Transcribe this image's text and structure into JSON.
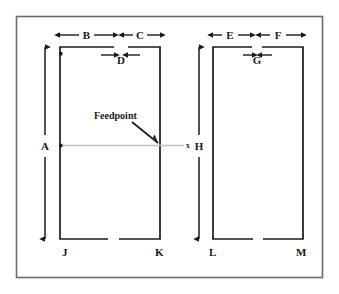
{
  "figure": {
    "background_color": "#ffffff",
    "frame_color": "#555555",
    "line_color": "#1a1a1a",
    "feedline_color": "#b8b8b8"
  },
  "callout": {
    "label": "Feedpoint"
  },
  "dimensions": {
    "vertical": [
      {
        "id": "A",
        "label": "A",
        "element": "left"
      },
      {
        "id": "H",
        "label": "H",
        "element": "right"
      }
    ],
    "horizontal_outer": [
      {
        "id": "B",
        "label": "B",
        "element": "left",
        "side": "left"
      },
      {
        "id": "C",
        "label": "C",
        "element": "left",
        "side": "right"
      },
      {
        "id": "E",
        "label": "E",
        "element": "right",
        "side": "left"
      },
      {
        "id": "F",
        "label": "F",
        "element": "right",
        "side": "right"
      }
    ],
    "gaps": [
      {
        "id": "D",
        "label": "D",
        "element": "left"
      },
      {
        "id": "G",
        "label": "G",
        "element": "right"
      }
    ]
  },
  "nodes": [
    {
      "id": "J",
      "label": "J",
      "element": "left",
      "corner": "bottom-left"
    },
    {
      "id": "K",
      "label": "K",
      "element": "left",
      "corner": "bottom-right"
    },
    {
      "id": "L",
      "label": "L",
      "element": "right",
      "corner": "bottom-left"
    },
    {
      "id": "M",
      "label": "M",
      "element": "right",
      "corner": "bottom-right"
    }
  ],
  "ticks": [
    {
      "id": "tick-left-top",
      "label": "x"
    },
    {
      "id": "tick-left-feed",
      "label": "x"
    },
    {
      "id": "tick-feedline-end",
      "label": "x"
    }
  ]
}
